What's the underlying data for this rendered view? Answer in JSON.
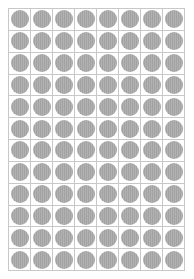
{
  "grid": {
    "columns": 8,
    "rows": 12,
    "cell_shape": "circle",
    "circle_color": "#a9a9a9",
    "line_color": "#c8c8c8",
    "background": "#ffffff"
  }
}
